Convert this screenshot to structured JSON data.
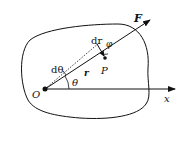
{
  "labels": {
    "force": "F",
    "displacement": "dr",
    "angle_phi": "φ",
    "angle_dtheta": "dθ",
    "position_vector": "r",
    "point": "P",
    "origin": "O",
    "angle_theta": "θ",
    "x_axis": "x"
  },
  "colors": {
    "stroke": "#111111",
    "background": "#ffffff"
  }
}
